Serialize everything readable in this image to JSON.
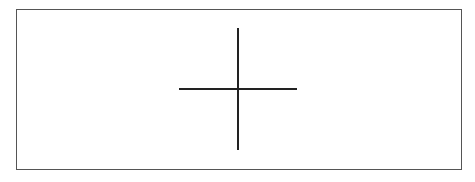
{
  "canvas": {
    "background_color": "#ffffff",
    "border_color": "#555555"
  },
  "crosshair": {
    "icon": "crosshair-icon",
    "color": "#222222"
  }
}
